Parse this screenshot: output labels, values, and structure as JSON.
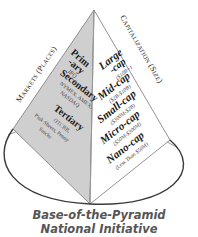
{
  "diagram": {
    "left_axis_label": "Markets (Places)",
    "right_axis_label": "Capitalization (Size)",
    "left_face": {
      "fill": "#cfcfcf",
      "tiers": [
        {
          "name": "Prim",
          "name2": "-ary",
          "detail": "IPO"
        },
        {
          "name": "Secondary",
          "detail": "NYMEX, AMEX,",
          "detail2": "NASDAQ"
        },
        {
          "name": "Tertiary",
          "detail": "OTCBB,",
          "detail2": "Pink Sheets, Penny",
          "detail3": "Stocks"
        }
      ]
    },
    "right_face": {
      "fill": "#ffffff",
      "tiers": [
        {
          "name": "Large",
          "name2": "-cap",
          "detail": "($10B+)"
        },
        {
          "name": "Mid-cap",
          "detail": "($2B-$10B)"
        },
        {
          "name": "Small-cap",
          "detail": "($300M-$2B)"
        },
        {
          "name": "Micro-cap",
          "detail": "($50M-$300M)"
        },
        {
          "name": "Nano-cap",
          "detail": "(Less Than $50M)"
        }
      ]
    },
    "caption": {
      "line1": "Base-of-the-Pyramid",
      "line2": "National Initiative"
    },
    "colors": {
      "outline": "#555555",
      "ellipse": "#3a3a3a",
      "text": "#1a1a1a",
      "caption": "#555555"
    }
  }
}
